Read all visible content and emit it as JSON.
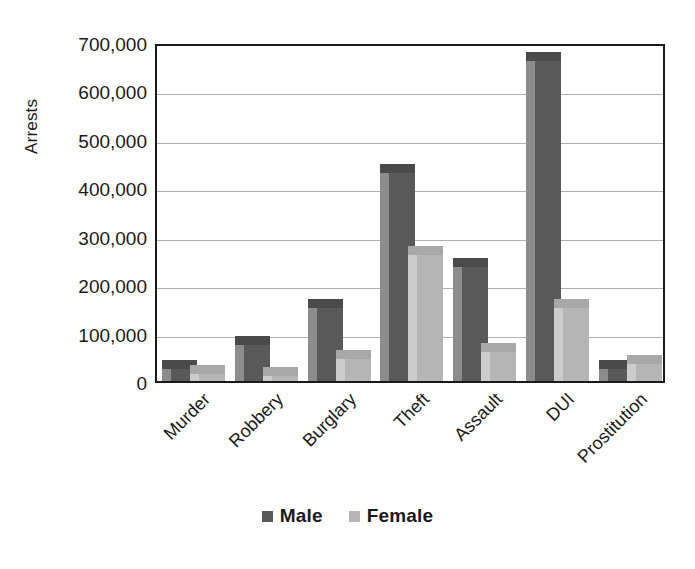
{
  "chart_data": {
    "type": "bar",
    "title": "",
    "subtitle": "",
    "xlabel": "",
    "ylabel": "Arrests",
    "categories": [
      "Murder",
      "Robbery",
      "Burglary",
      "Theft",
      "Assault",
      "DUI",
      "Prostitution"
    ],
    "series": [
      {
        "name": "Male",
        "color": "#595959",
        "side_color": "#8c8c8c",
        "top_color": "#4a4a4a",
        "values": [
          25000,
          75000,
          150000,
          430000,
          235000,
          660000,
          25000
        ]
      },
      {
        "name": "Female",
        "color": "#b5b5b5",
        "side_color": "#cccccc",
        "top_color": "#a8a8a8",
        "values": [
          15000,
          10000,
          45000,
          260000,
          60000,
          150000,
          35000
        ]
      }
    ],
    "ylim": [
      0,
      700000
    ],
    "y_ticks": [
      0,
      100000,
      200000,
      300000,
      400000,
      500000,
      600000,
      700000
    ],
    "y_tick_labels": [
      "0",
      "100,000",
      "200,000",
      "300,000",
      "400,000",
      "500,000",
      "600,000",
      "700,000"
    ],
    "grid": true,
    "grid_axis": "y",
    "legend_position": "bottom",
    "legend_entries": [
      "Male",
      "Female"
    ],
    "style": "3d-bar",
    "background_color": "#ffffff",
    "axis_color": "#1a1a1a",
    "gridline_color": "#b0b0b0"
  }
}
